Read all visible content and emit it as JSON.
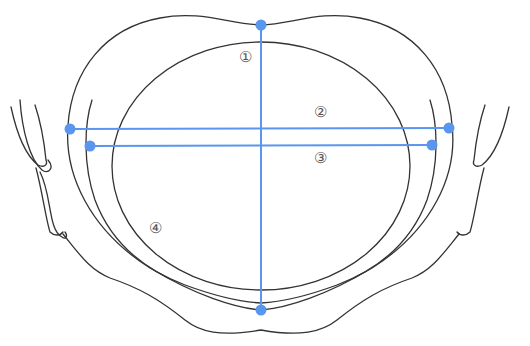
{
  "diagram": {
    "type": "anatomical-pelvis-inlet-measurements",
    "colors": {
      "outline": "#333333",
      "measurement_line": "#5a96ee",
      "label": "#555555",
      "background": "#ffffff"
    },
    "measurements": [
      {
        "id": "1",
        "label": "①",
        "orientation": "vertical"
      },
      {
        "id": "2",
        "label": "②",
        "orientation": "horizontal"
      },
      {
        "id": "3",
        "label": "③",
        "orientation": "horizontal"
      },
      {
        "id": "4",
        "label": "④",
        "orientation": "region"
      }
    ]
  }
}
